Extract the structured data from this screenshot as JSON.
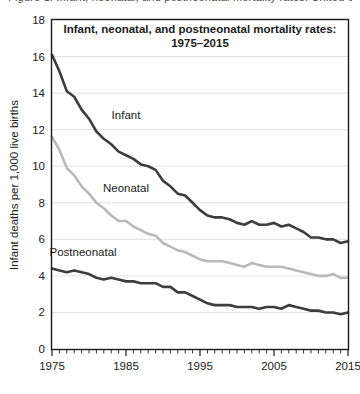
{
  "figure": {
    "clipped_header_text": "Figure 1. Infant, neonatal, and postneonatal mortality rates: United States, 1975-2015",
    "background": "#ffffff"
  },
  "chart_data": {
    "type": "line",
    "title": "Infant, neonatal, and postneonatal mortality rates:",
    "subtitle": "1975–2015",
    "xlabel": "",
    "ylabel": "Infant deaths per 1,000 live births",
    "xlim": [
      1975,
      2015
    ],
    "ylim": [
      0,
      18
    ],
    "ytick_step": 2,
    "yticks": [
      0,
      2,
      4,
      6,
      8,
      10,
      12,
      14,
      16,
      18
    ],
    "ytick_labels": [
      "0",
      "2",
      "4",
      "6",
      "8",
      "10",
      "12",
      "14",
      "16",
      "18"
    ],
    "xticks": [
      1975,
      1985,
      1995,
      2005,
      2015
    ],
    "xtick_labels": [
      "1975",
      "1985",
      "1995",
      "2005",
      "2015"
    ],
    "x_minor_tick_step": 1,
    "grid": "horizontal",
    "grid_color": "#d9d9d9",
    "legend_position": "inline-annotations",
    "x": [
      1975,
      1976,
      1977,
      1978,
      1979,
      1980,
      1981,
      1982,
      1983,
      1984,
      1985,
      1986,
      1987,
      1988,
      1989,
      1990,
      1991,
      1992,
      1993,
      1994,
      1995,
      1996,
      1997,
      1998,
      1999,
      2000,
      2001,
      2002,
      2003,
      2004,
      2005,
      2006,
      2007,
      2008,
      2009,
      2010,
      2011,
      2012,
      2013,
      2014,
      2015
    ],
    "series": [
      {
        "name": "Infant",
        "color": "#3d3d3d",
        "label_x": 1985,
        "label_y": 12.6,
        "values": [
          16.1,
          15.2,
          14.1,
          13.8,
          13.1,
          12.6,
          11.9,
          11.5,
          11.2,
          10.8,
          10.6,
          10.4,
          10.1,
          10.0,
          9.8,
          9.2,
          8.9,
          8.5,
          8.4,
          8.0,
          7.6,
          7.3,
          7.2,
          7.2,
          7.1,
          6.9,
          6.8,
          7.0,
          6.8,
          6.8,
          6.9,
          6.7,
          6.8,
          6.6,
          6.4,
          6.1,
          6.1,
          6.0,
          6.0,
          5.8,
          5.9
        ]
      },
      {
        "name": "Neonatal",
        "color": "#b9b9b9",
        "label_x": 1985,
        "label_y": 8.6,
        "values": [
          11.6,
          10.9,
          9.9,
          9.5,
          8.9,
          8.5,
          8.0,
          7.7,
          7.3,
          7.0,
          7.0,
          6.7,
          6.5,
          6.3,
          6.2,
          5.8,
          5.6,
          5.4,
          5.3,
          5.1,
          4.9,
          4.8,
          4.8,
          4.8,
          4.7,
          4.6,
          4.5,
          4.7,
          4.6,
          4.5,
          4.5,
          4.5,
          4.4,
          4.3,
          4.2,
          4.1,
          4.0,
          4.0,
          4.1,
          3.9,
          3.9
        ]
      },
      {
        "name": "Postneonatal",
        "color": "#3d3d3d",
        "label_x": 1979.2,
        "label_y": 5.1,
        "values": [
          4.4,
          4.3,
          4.2,
          4.3,
          4.2,
          4.1,
          3.9,
          3.8,
          3.9,
          3.8,
          3.7,
          3.7,
          3.6,
          3.6,
          3.6,
          3.4,
          3.4,
          3.1,
          3.1,
          2.9,
          2.7,
          2.5,
          2.4,
          2.4,
          2.4,
          2.3,
          2.3,
          2.3,
          2.2,
          2.3,
          2.3,
          2.2,
          2.4,
          2.3,
          2.2,
          2.1,
          2.1,
          2.0,
          2.0,
          1.9,
          2.0
        ]
      }
    ]
  }
}
